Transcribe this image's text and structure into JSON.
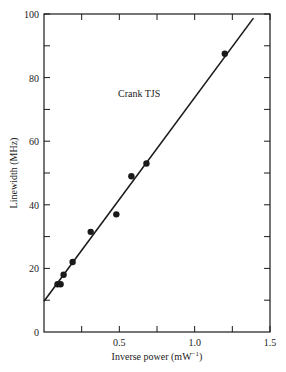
{
  "chart_data": {
    "type": "scatter",
    "title": "",
    "annotation": "Crank TJS",
    "xlabel": "Inverse power (mW",
    "xlabel_sup": "−1",
    "xlabel_close": ")",
    "ylabel": "Linewidth (MHz)",
    "xlim": [
      0,
      1.5
    ],
    "ylim": [
      0,
      100
    ],
    "x_ticks": [
      0.25,
      0.5,
      0.75,
      1.0,
      1.25,
      1.5
    ],
    "x_tick_labels": [
      {
        "value": 0.5,
        "label": "0.5"
      },
      {
        "value": 1.0,
        "label": "1.0"
      },
      {
        "value": 1.5,
        "label": "1.5"
      }
    ],
    "y_ticks": [
      10,
      20,
      30,
      40,
      50,
      60,
      70,
      80,
      90,
      100
    ],
    "y_tick_labels": [
      {
        "value": 0,
        "label": "0"
      },
      {
        "value": 20,
        "label": "20"
      },
      {
        "value": 40,
        "label": "40"
      },
      {
        "value": 60,
        "label": "60"
      },
      {
        "value": 80,
        "label": "80"
      },
      {
        "value": 100,
        "label": "100"
      }
    ],
    "grid": false,
    "series": [
      {
        "name": "measured",
        "kind": "points",
        "points": [
          {
            "x": 0.09,
            "y": 15
          },
          {
            "x": 0.11,
            "y": 15
          },
          {
            "x": 0.13,
            "y": 18
          },
          {
            "x": 0.19,
            "y": 22
          },
          {
            "x": 0.31,
            "y": 31.5
          },
          {
            "x": 0.48,
            "y": 37
          },
          {
            "x": 0.58,
            "y": 49
          },
          {
            "x": 0.68,
            "y": 53
          },
          {
            "x": 1.2,
            "y": 87.5
          }
        ]
      },
      {
        "name": "linear fit",
        "kind": "line",
        "points": [
          {
            "x": 0.0,
            "y": 9.7
          },
          {
            "x": 1.39,
            "y": 98.7
          }
        ]
      }
    ],
    "colors": {
      "ink": "#1a1a1a",
      "background": "#ffffff"
    }
  }
}
